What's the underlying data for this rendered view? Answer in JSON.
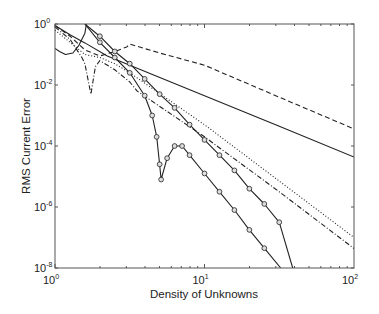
{
  "chart_data": {
    "type": "line",
    "title": "",
    "xlabel": "Density of Unknowns",
    "ylabel": "RMS Current Error",
    "xscale": "log",
    "yscale": "log",
    "xlim": [
      1,
      100
    ],
    "ylim": [
      1e-08,
      1
    ],
    "grid": false,
    "legend": null,
    "x_ticks": [
      {
        "value": 1,
        "base": "10",
        "exp": "0"
      },
      {
        "value": 10,
        "base": "10",
        "exp": "1"
      },
      {
        "value": 100,
        "base": "10",
        "exp": "2"
      }
    ],
    "y_ticks": [
      {
        "value": 1,
        "base": "10",
        "exp": "0"
      },
      {
        "value": 0.01,
        "base": "10",
        "exp": "-2"
      },
      {
        "value": 0.0001,
        "base": "10",
        "exp": "-4"
      },
      {
        "value": 1e-06,
        "base": "10",
        "exp": "-6"
      },
      {
        "value": 1e-08,
        "base": "10",
        "exp": "-8"
      }
    ],
    "series": [
      {
        "name": "solid",
        "style": "solid",
        "marker": "none",
        "points_log10": [
          [
            0,
            -0.05
          ],
          [
            0.1,
            -0.35
          ],
          [
            0.2,
            -0.62
          ],
          [
            0.35,
            -1.05
          ],
          [
            0.5,
            -1.35
          ],
          [
            1.0,
            -2.35
          ],
          [
            1.5,
            -3.35
          ],
          [
            2.0,
            -4.36
          ]
        ]
      },
      {
        "name": "solid-loop",
        "style": "solid",
        "marker": "none",
        "points_log10": [
          [
            0,
            -0.8
          ],
          [
            0.03,
            -0.9
          ],
          [
            0.07,
            -1.0
          ],
          [
            0.12,
            -0.95
          ],
          [
            0.16,
            -0.7
          ],
          [
            0.2,
            -0.3
          ],
          [
            0.21,
            0
          ]
        ]
      },
      {
        "name": "dashed",
        "style": "dashed",
        "marker": "none",
        "points_log10": [
          [
            0,
            -0.05
          ],
          [
            0.1,
            -0.4
          ],
          [
            0.2,
            -0.85
          ],
          [
            0.3,
            -1.05
          ],
          [
            0.4,
            -0.9
          ],
          [
            0.48,
            -0.75
          ],
          [
            0.5,
            -0.66
          ],
          [
            0.7,
            -0.95
          ],
          [
            1.0,
            -1.35
          ],
          [
            1.5,
            -2.4
          ],
          [
            2.0,
            -3.44
          ]
        ]
      },
      {
        "name": "dotted",
        "style": "dotted",
        "marker": "none",
        "points_log10": [
          [
            0,
            -0.2
          ],
          [
            0.1,
            -0.6
          ],
          [
            0.2,
            -1.0
          ],
          [
            0.3,
            -1.1
          ],
          [
            0.4,
            -1.3
          ],
          [
            0.5,
            -1.6
          ],
          [
            1.0,
            -3.3
          ],
          [
            1.5,
            -5.15
          ],
          [
            2.0,
            -7.0
          ]
        ]
      },
      {
        "name": "dash-dot",
        "style": "dashdot",
        "marker": "none",
        "points_log10": [
          [
            0,
            -0.1
          ],
          [
            0.1,
            -0.5
          ],
          [
            0.18,
            -1.1
          ],
          [
            0.2,
            -1.3
          ],
          [
            0.24,
            -2.3
          ],
          [
            0.27,
            -1.4
          ],
          [
            0.3,
            -1.2
          ],
          [
            0.4,
            -1.5
          ],
          [
            0.5,
            -1.9
          ],
          [
            0.55,
            -2.2
          ],
          [
            1.0,
            -3.7
          ],
          [
            1.5,
            -5.5
          ],
          [
            2.0,
            -7.36
          ]
        ]
      },
      {
        "name": "circle-markers-upper",
        "style": "solid",
        "marker": "circle",
        "points_log10": [
          [
            0.2,
            0
          ],
          [
            0.3,
            -0.4
          ],
          [
            0.4,
            -0.9
          ],
          [
            0.5,
            -1.3
          ],
          [
            0.6,
            -1.8
          ],
          [
            0.7,
            -2.3
          ],
          [
            0.8,
            -2.75
          ],
          [
            0.9,
            -3.3
          ],
          [
            1.0,
            -3.8
          ],
          [
            1.1,
            -4.3
          ],
          [
            1.2,
            -4.8
          ],
          [
            1.3,
            -5.4
          ],
          [
            1.4,
            -5.9
          ],
          [
            1.5,
            -6.5
          ],
          [
            1.59,
            -8.0
          ]
        ]
      },
      {
        "name": "circle-markers-lower",
        "style": "solid",
        "marker": "circle",
        "points_log10": [
          [
            0.2,
            0
          ],
          [
            0.3,
            -0.6
          ],
          [
            0.4,
            -1.1
          ],
          [
            0.5,
            -1.6
          ],
          [
            0.6,
            -2.35
          ],
          [
            0.65,
            -3.0
          ],
          [
            0.68,
            -3.7
          ],
          [
            0.7,
            -4.6
          ],
          [
            0.71,
            -5.1
          ],
          [
            0.75,
            -4.4
          ],
          [
            0.8,
            -4.0
          ],
          [
            0.85,
            -4.0
          ],
          [
            0.9,
            -4.3
          ],
          [
            1.0,
            -4.9
          ],
          [
            1.1,
            -5.5
          ],
          [
            1.2,
            -6.1
          ],
          [
            1.3,
            -6.75
          ],
          [
            1.4,
            -7.35
          ],
          [
            1.51,
            -8.0
          ]
        ]
      }
    ]
  }
}
